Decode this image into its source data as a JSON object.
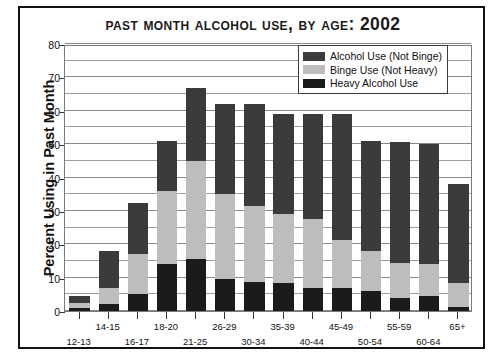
{
  "figure": {
    "title": "Past Month Alcohol Use, by Age: 2002"
  },
  "legend": {
    "items": [
      {
        "label": "Alcohol Use (Not Binge)",
        "color": "#3b3b3b",
        "key": "alcohol_not_binge"
      },
      {
        "label": "Binge Use (Not Heavy)",
        "color": "#bdbdbd",
        "key": "binge_not_heavy"
      },
      {
        "label": "Heavy Alcohol Use",
        "color": "#1b1b1b",
        "key": "heavy_alcohol"
      }
    ]
  },
  "chart_data": {
    "type": "bar",
    "subtype": "stacked",
    "title": "Past Month Alcohol Use, by Age: 2002",
    "xlabel": "",
    "ylabel": "Percent Using in Past Month",
    "ylim": [
      0,
      80
    ],
    "ytick_step": 10,
    "yminor_step": 5,
    "yticks": [
      0,
      10,
      20,
      30,
      40,
      50,
      60,
      70,
      80
    ],
    "grid": true,
    "legend_position": "top-right",
    "categories": [
      "12-13",
      "14-15",
      "16-17",
      "18-20",
      "21-25",
      "26-29",
      "30-34",
      "35-39",
      "40-44",
      "45-49",
      "50-54",
      "55-59",
      "60-64",
      "65+"
    ],
    "series": [
      {
        "name": "Heavy Alcohol Use",
        "color": "#1b1b1b",
        "values": [
          1.0,
          2.2,
          5.0,
          14.0,
          15.5,
          9.5,
          8.7,
          8.5,
          7.0,
          6.8,
          6.0,
          4.0,
          4.5,
          1.2
        ]
      },
      {
        "name": "Binge Use (Not Heavy)",
        "color": "#bdbdbd",
        "values": [
          1.3,
          4.6,
          12.0,
          22.0,
          29.5,
          25.5,
          22.8,
          20.5,
          20.5,
          14.5,
          12.0,
          10.5,
          9.5,
          7.3
        ]
      },
      {
        "name": "Alcohol Use (Not Binge)",
        "color": "#3b3b3b",
        "values": [
          2.2,
          11.2,
          15.5,
          15.0,
          21.7,
          27.0,
          30.5,
          30.0,
          31.5,
          37.7,
          33.0,
          36.0,
          36.0,
          29.5
        ]
      }
    ],
    "totals": [
      4.5,
      18.0,
      32.5,
      51.0,
      66.7,
      62.0,
      62.0,
      59.0,
      59.0,
      59.0,
      51.0,
      50.5,
      50.0,
      38.0
    ]
  }
}
